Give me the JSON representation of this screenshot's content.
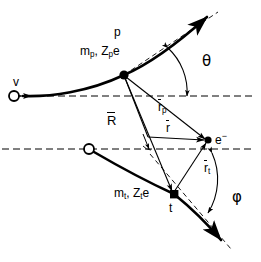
{
  "figure": {
    "stroke_color": "#000000",
    "background": "#ffffff"
  },
  "labels": {
    "projectile_symbol": "p",
    "projectile_mass_charge": "m",
    "projectile_mass_sub": "p",
    "projectile_charge": ", Z",
    "projectile_charge_sub": "p",
    "projectile_charge_e": "e",
    "velocity": "v",
    "scattering_angle": "θ",
    "recoil_angle": "φ",
    "r_p_base": "r",
    "r_p_sub": "p",
    "r_t_base": "r",
    "r_t_sub": "t",
    "R_vector": "R",
    "r_vector": "r",
    "electron": "e",
    "electron_charge_sign": "−",
    "target_symbol": "t",
    "target_mass_charge": "m",
    "target_mass_sub": "t",
    "target_charge": ", Z",
    "target_charge_sub": "t",
    "target_charge_e": "e"
  },
  "geometry": {
    "projectile_vertex": [
      124,
      75
    ],
    "electron_position": [
      208,
      140
    ],
    "target_vertex": [
      174,
      194
    ],
    "target_origin": [
      89,
      149
    ],
    "projectile_origin": [
      14,
      95
    ]
  }
}
